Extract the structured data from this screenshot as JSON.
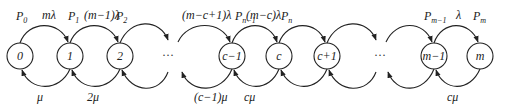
{
  "diagram": {
    "type": "birth-death-markov-chain",
    "nodes": [
      {
        "id": "n0",
        "label": "0",
        "x": 20
      },
      {
        "id": "n1",
        "label": "1",
        "x": 70
      },
      {
        "id": "n2",
        "label": "2",
        "x": 120
      },
      {
        "id": "nc1",
        "label": "c−1",
        "x": 232
      },
      {
        "id": "nc",
        "label": "c",
        "x": 279
      },
      {
        "id": "ncp1",
        "label": "c+1",
        "x": 327
      },
      {
        "id": "nm1",
        "label": "m−1",
        "x": 434
      },
      {
        "id": "nm",
        "label": "m",
        "x": 480
      }
    ],
    "ellipsis": [
      {
        "id": "dots1",
        "label": "···",
        "x": 168
      },
      {
        "id": "dots2",
        "label": "···",
        "x": 380
      }
    ],
    "state_probabilities": {
      "p0": "P",
      "p0_sub": "0",
      "p1": "P",
      "p1_sub": "1",
      "p2": "P",
      "p2_sub": "2",
      "pn1": "P",
      "pn1_sub": "n−1",
      "pn": "P",
      "pn_sub": "n",
      "pm1": "P",
      "pm1_sub": "m−1",
      "pm": "P",
      "pm_sub": "m"
    },
    "arrival_rates": {
      "r01": "mλ",
      "r12": "(m−1)λ",
      "rc1c": "(m−c+1)λ",
      "rcc1": "(m−c)λ",
      "rm1m": "λ"
    },
    "service_rates": {
      "s10": "μ",
      "s21": "2μ",
      "sc_c1": "(c−1)μ",
      "s_c": "cμ",
      "s_m": "cμ"
    }
  }
}
